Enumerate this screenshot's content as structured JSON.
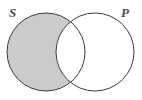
{
  "figure": {
    "kind": "venn-diagram",
    "background_color": "#ffffff",
    "width": 142,
    "height": 100
  },
  "labels": {
    "left_circle": "S",
    "right_circle": "P",
    "label_color": "#4a4a4a"
  },
  "circles": {
    "left": {
      "name": "S",
      "cx": 46,
      "cy": 52,
      "r": 39,
      "stroke": "#3c3c3c",
      "stroke_width": 1,
      "fill": "none"
    },
    "right": {
      "name": "P",
      "cx": 95,
      "cy": 52,
      "r": 39,
      "stroke": "#3c3c3c",
      "stroke_width": 1,
      "fill": "none"
    }
  },
  "regions": [
    {
      "name": "s-only",
      "description": "S and not P (left crescent)",
      "shaded": true,
      "fill": "#cbcbcb"
    },
    {
      "name": "s-and-p",
      "description": "intersection lens of S and P",
      "shaded": false,
      "fill": "#ffffff"
    },
    {
      "name": "p-only",
      "description": "P and not S (right crescent)",
      "shaded": false,
      "fill": "#ffffff"
    }
  ],
  "colors": {
    "shade": "#cbcbcb",
    "outline": "#3c3c3c",
    "background": "#ffffff"
  },
  "intersection_points": {
    "top": {
      "x": 71,
      "y": 15
    },
    "bottom": {
      "x": 71,
      "y": 82
    }
  }
}
